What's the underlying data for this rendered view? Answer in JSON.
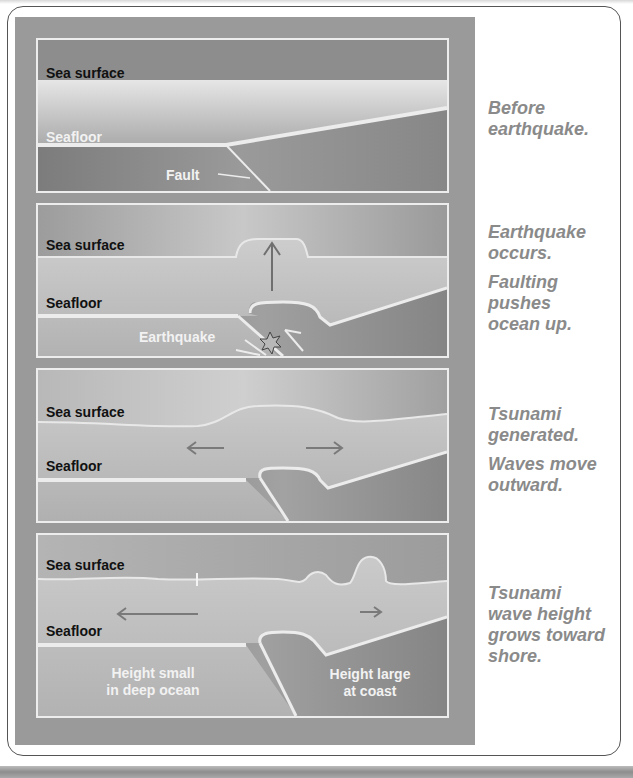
{
  "diagram": {
    "colors": {
      "sky": "#a9a9a9",
      "water": "#c4c4c4",
      "seafloor_line": "#ececec",
      "crust": "#8c8c8c",
      "caption_text": "#8a8a8a",
      "arrow": "#777777"
    },
    "panels": [
      {
        "id": "before",
        "labels": {
          "sea_surface": "Sea surface",
          "seafloor": "Seafloor",
          "fault": "Fault"
        },
        "captions": [
          "Before earthquake."
        ]
      },
      {
        "id": "earthquake",
        "labels": {
          "sea_surface": "Sea surface",
          "seafloor": "Seafloor",
          "earthquake": "Earthquake"
        },
        "captions": [
          "Earthquake occurs.",
          "Faulting pushes ocean up."
        ]
      },
      {
        "id": "generated",
        "labels": {
          "sea_surface": "Sea surface",
          "seafloor": "Seafloor"
        },
        "captions": [
          "Tsunami generated.",
          "Waves move outward."
        ]
      },
      {
        "id": "growth",
        "labels": {
          "sea_surface": "Sea surface",
          "seafloor": "Seafloor",
          "deep_line1": "Height small",
          "deep_line2": "in deep ocean",
          "coast_line1": "Height large",
          "coast_line2": "at coast"
        },
        "captions": [
          "Tsunami wave height grows toward shore."
        ]
      }
    ]
  }
}
